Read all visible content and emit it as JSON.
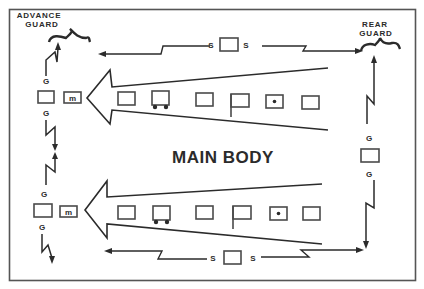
{
  "diagram": {
    "title": "MAIN BODY",
    "labels": {
      "advance_guard_line1": "ADVANCE",
      "advance_guard_line2": "GUARD",
      "rear_guard_line1": "REAR",
      "rear_guard_line2": "GUARD"
    },
    "security": {
      "top": {
        "left": "S",
        "right": "S"
      },
      "bottom": {
        "left": "S",
        "right": "S"
      }
    },
    "guards": {
      "left_top_upper": "G",
      "left_top_lower": "G",
      "left_bottom_upper": "G",
      "left_bottom_lower": "G",
      "right_upper": "G",
      "right_lower": "G"
    },
    "columns": [
      {
        "name": "upper-column",
        "units": [
          "vehicle-box",
          "wheeled-vehicle",
          "vehicle-box",
          "flag",
          "command-post",
          "vehicle-box"
        ]
      },
      {
        "name": "lower-column",
        "units": [
          "vehicle-box",
          "wheeled-vehicle",
          "vehicle-box",
          "flag",
          "command-post",
          "vehicle-box"
        ]
      }
    ],
    "colors": {
      "ink": "#2b2b2b",
      "border": "#555555",
      "background": "#ffffff"
    }
  }
}
